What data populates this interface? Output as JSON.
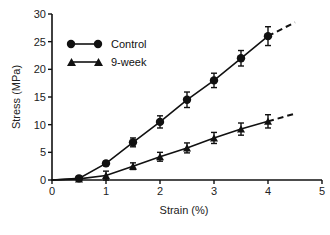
{
  "chart_data": {
    "type": "line",
    "title": "",
    "xlabel": "Strain (%)",
    "ylabel": "Stress (MPa)",
    "xlim": [
      0,
      5
    ],
    "ylim": [
      0,
      30
    ],
    "xticks": [
      0,
      1,
      2,
      3,
      4,
      5
    ],
    "yticks": [
      0,
      5,
      10,
      15,
      20,
      25,
      30
    ],
    "grid": false,
    "legend_position": "upper-left",
    "series": [
      {
        "name": "Control",
        "marker": "circle",
        "x": [
          0.5,
          1.0,
          1.5,
          2.0,
          2.5,
          3.0,
          3.5,
          4.0
        ],
        "values": [
          0.3,
          3.0,
          6.8,
          10.5,
          14.5,
          18.0,
          22.0,
          26.0
        ],
        "error": [
          0.3,
          0.4,
          0.8,
          1.1,
          1.4,
          1.3,
          1.4,
          1.7
        ],
        "extrapolation": {
          "style": "dashed",
          "x": [
            4.0,
            4.5
          ],
          "values": [
            26.0,
            28.5
          ]
        }
      },
      {
        "name": "9-week",
        "marker": "triangle",
        "x": [
          0.5,
          1.0,
          1.5,
          2.0,
          2.5,
          3.0,
          3.5,
          4.0
        ],
        "values": [
          0.2,
          0.8,
          2.5,
          4.2,
          5.8,
          7.6,
          9.2,
          10.6
        ],
        "error": [
          0.2,
          0.8,
          0.6,
          0.8,
          0.9,
          1.0,
          1.1,
          1.2
        ],
        "extrapolation": {
          "style": "dashed",
          "x": [
            4.0,
            4.5
          ],
          "values": [
            10.6,
            12.0
          ]
        }
      }
    ]
  },
  "legend": {
    "items": [
      {
        "label": "Control",
        "marker": "circle"
      },
      {
        "label": "9-week",
        "marker": "triangle"
      }
    ]
  },
  "axes": {
    "x_title": "Strain (%)",
    "y_title": "Stress (MPa)",
    "x_tick_labels": [
      "0",
      "1",
      "2",
      "3",
      "4",
      "5"
    ],
    "y_tick_labels": [
      "0",
      "5",
      "10",
      "15",
      "20",
      "25",
      "30"
    ]
  },
  "colors": {
    "ink": "#111111",
    "background": "#ffffff"
  }
}
